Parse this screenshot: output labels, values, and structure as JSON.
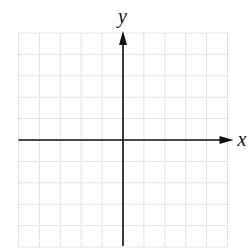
{
  "diagram": {
    "type": "coordinate-plane",
    "x_label": "x",
    "y_label": "y",
    "grid": {
      "columns": 10,
      "rows": 10,
      "left": 18.5,
      "top": 33,
      "cell_width": 20.9,
      "cell_height": 21.4,
      "line_color": "#c8c8c8"
    },
    "axes": {
      "color": "#111111",
      "origin_col": 5,
      "origin_row": 5,
      "x_arrow": "right",
      "y_arrow": "up"
    }
  }
}
